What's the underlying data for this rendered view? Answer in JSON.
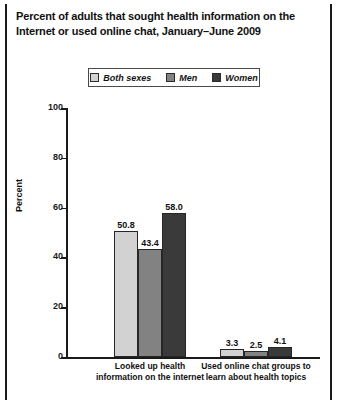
{
  "title": {
    "line1": "Percent of adults that sought health information on the",
    "line2": "Internet or used online chat, January–June 2009"
  },
  "legend": {
    "items": [
      {
        "label": "Both sexes",
        "color": "#d2d2d2"
      },
      {
        "label": "Men",
        "color": "#828282"
      },
      {
        "label": "Women",
        "color": "#3a3a3a"
      }
    ]
  },
  "axis": {
    "ylabel": "Percent",
    "yticks": [
      "0",
      "20",
      "40",
      "60",
      "80",
      "100"
    ]
  },
  "chart_data": {
    "type": "bar",
    "title": "Percent of adults that sought health information on the Internet or used online chat, January–June 2009",
    "xlabel": "",
    "ylabel": "Percent",
    "ylim": [
      0,
      100
    ],
    "yticks": [
      0,
      20,
      40,
      60,
      80,
      100
    ],
    "grid": false,
    "legend_position": "top-center",
    "categories": [
      "Looked up health\ninformation on the internet",
      "Used online chat groups to\nlearn about health topics"
    ],
    "series": [
      {
        "name": "Both sexes",
        "color": "#d2d2d2",
        "values": [
          50.8,
          3.3
        ],
        "labels": [
          "50.8",
          "3.3"
        ]
      },
      {
        "name": "Men",
        "color": "#828282",
        "values": [
          43.4,
          2.5
        ],
        "labels": [
          "43.4",
          "2.5"
        ]
      },
      {
        "name": "Women",
        "color": "#3a3a3a",
        "values": [
          58.0,
          4.1
        ],
        "labels": [
          "58.0",
          "4.1"
        ]
      }
    ]
  }
}
